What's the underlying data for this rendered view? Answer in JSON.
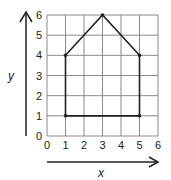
{
  "chart_data": {
    "type": "line",
    "title": "",
    "xlabel": "x",
    "ylabel": "y",
    "xlim": [
      0,
      6
    ],
    "ylim": [
      0,
      6
    ],
    "xticks": [
      "0",
      "1",
      "2",
      "3",
      "4",
      "5",
      "6"
    ],
    "yticks": [
      "0",
      "1",
      "2",
      "3",
      "4",
      "5",
      "6"
    ],
    "grid": true,
    "legend": null,
    "series": [
      {
        "name": "house-shape",
        "closed": true,
        "points": [
          {
            "x": 1,
            "y": 1
          },
          {
            "x": 1,
            "y": 4
          },
          {
            "x": 3,
            "y": 6
          },
          {
            "x": 5,
            "y": 4
          },
          {
            "x": 5,
            "y": 1
          }
        ]
      }
    ]
  },
  "labels": {
    "x_axis": "x",
    "y_axis": "y"
  },
  "colors": {
    "grid": "#8a8a8a",
    "line": "#222222",
    "background": "#ffffff"
  }
}
